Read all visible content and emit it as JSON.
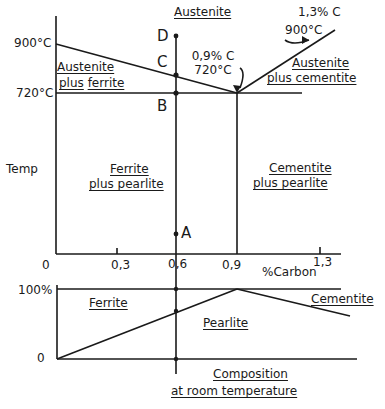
{
  "diagram": {
    "type": "iron-carbon phase diagram (steel region) with room-temperature composition chart",
    "upper": {
      "top_region": "Austenite",
      "temps": {
        "t900": "900°C",
        "t720": "720°C"
      },
      "y_axis_label": "Temp",
      "x_axis_label": "%Carbon",
      "x_ticks": [
        "0",
        "0,3",
        "0,6",
        "0,9",
        "1,3"
      ],
      "regions": {
        "aus_ferrite_l1": "Austenite",
        "aus_ferrite_l2a": "plus",
        "aus_ferrite_l2b": "ferrite",
        "aus_cem_l1": "Austenite",
        "aus_cem_l2": "plus cementite",
        "fer_pearl_l1": "Ferrite",
        "fer_pearl_l2": "plus pearlite",
        "cem_pearl_l1": "Cementite",
        "cem_pearl_l2": "plus pearlite"
      },
      "eutectoid": {
        "carbon": "0,9% C",
        "temp": "720°C"
      },
      "hyper_point": {
        "carbon": "1,3% C",
        "temp": "900°C"
      },
      "points": {
        "A": "A",
        "B": "B",
        "C": "C",
        "D": "D"
      }
    },
    "lower": {
      "y_ticks": {
        "top": "100%",
        "bottom": "0"
      },
      "regions": {
        "ferrite": "Ferrite",
        "pearlite": "Pearlite",
        "cementite": "Cementite"
      },
      "caption_l1": "Composition",
      "caption_l2": "at room temperature"
    }
  }
}
